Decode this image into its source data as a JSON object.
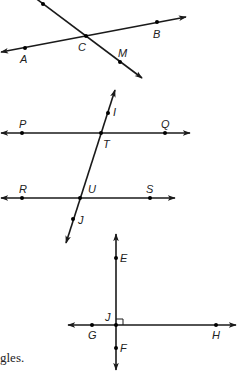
{
  "figures": [
    {
      "id": "intersecting-lines",
      "description": "Line AB intersects a second line through M at point C",
      "points": [
        {
          "name": "A",
          "x": 25,
          "y": 48,
          "label_dx": -5,
          "label_dy": 6
        },
        {
          "name": "C",
          "x": 86,
          "y": 36,
          "label_dx": -8,
          "label_dy": 6
        },
        {
          "name": "B",
          "x": 157,
          "y": 22,
          "label_dx": -4,
          "label_dy": 7
        },
        {
          "name": "M",
          "x": 120,
          "y": 62,
          "label_dx": -2,
          "label_dy": -14
        }
      ],
      "unlabeled_points": [
        {
          "x": 43,
          "y": 4
        }
      ]
    },
    {
      "id": "parallel-lines-transversal",
      "description": "Line PQ and line RS cut by transversal through I and J",
      "points": [
        {
          "name": "P",
          "x": 22,
          "y": 133,
          "label_dx": -2,
          "label_dy": -14
        },
        {
          "name": "T",
          "x": 101,
          "y": 133,
          "label_dx": 3,
          "label_dy": 5
        },
        {
          "name": "Q",
          "x": 165,
          "y": 133,
          "label_dx": -4,
          "label_dy": -14
        },
        {
          "name": "I",
          "x": 108,
          "y": 113,
          "label_dx": 5,
          "label_dy": -6
        },
        {
          "name": "R",
          "x": 22,
          "y": 198,
          "label_dx": -3,
          "label_dy": -14
        },
        {
          "name": "U",
          "x": 80,
          "y": 198,
          "label_dx": 5,
          "label_dy": -14
        },
        {
          "name": "S",
          "x": 150,
          "y": 198,
          "label_dx": -4,
          "label_dy": -14
        },
        {
          "name": "J",
          "x": 73,
          "y": 219,
          "label_dx": 5,
          "label_dy": -4
        }
      ]
    },
    {
      "id": "perpendicular-lines",
      "description": "Line GH perpendicular to line EF at point J",
      "points": [
        {
          "name": "E",
          "x": 116,
          "y": 258,
          "label_dx": 4,
          "label_dy": -5
        },
        {
          "name": "J",
          "x": 116,
          "y": 325,
          "label_dx": -11,
          "label_dy": -13
        },
        {
          "name": "G",
          "x": 92,
          "y": 325,
          "label_dx": -4,
          "label_dy": 5
        },
        {
          "name": "H",
          "x": 216,
          "y": 325,
          "label_dx": -4,
          "label_dy": 5
        },
        {
          "name": "F",
          "x": 116,
          "y": 348,
          "label_dx": 4,
          "label_dy": -5
        }
      ],
      "right_angle_marker": true
    }
  ],
  "caption_fragment": "gles."
}
